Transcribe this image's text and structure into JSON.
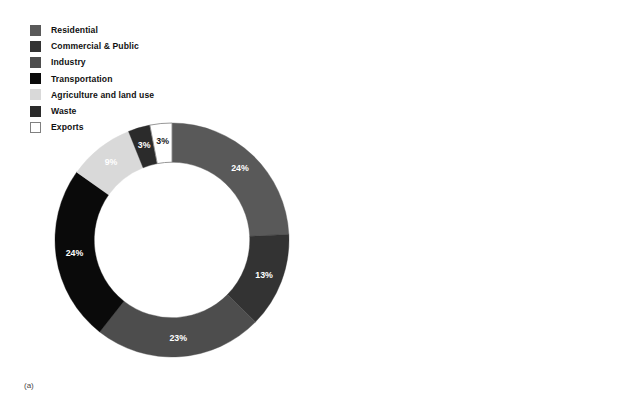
{
  "figure": {
    "background": "#ffffff",
    "panel_count": 2
  },
  "chart_data": [
    {
      "type": "pie",
      "variant": "donut",
      "panel": "a",
      "caption": "(a)",
      "title": "",
      "xlabel": "",
      "ylabel": "",
      "unit": "%",
      "start_angle_deg": 0,
      "direction": "clockwise",
      "inner_radius_ratio": 0.665,
      "total": 99,
      "legend_position": "top-left",
      "grid": false,
      "labels": [
        "Residential",
        "Commercial & Public",
        "Industry",
        "Transportation",
        "Agriculture and land use",
        "Waste",
        "Exports"
      ],
      "values": [
        24,
        13,
        23,
        24,
        9,
        3,
        3
      ],
      "value_labels": [
        "24%",
        "13%",
        "23%",
        "24%",
        "9%",
        "3%",
        "3%"
      ],
      "colors": [
        "#595959",
        "#333333",
        "#4d4d4d",
        "#0a0a0a",
        "#d9d9d9",
        "#2b2b2b",
        "#ffffff"
      ],
      "label_text_colors": [
        "#ffffff",
        "#ffffff",
        "#ffffff",
        "#ffffff",
        "#ffffff",
        "#ffffff",
        "#1a1a1a"
      ],
      "outlined_slices": [
        "Exports"
      ]
    },
    {
      "type": "pie",
      "variant": "donut",
      "panel": "b",
      "caption": "(b)",
      "title": "",
      "xlabel": "",
      "ylabel": "",
      "unit": "%",
      "start_angle_deg": 0,
      "direction": "clockwise",
      "inner_radius_ratio": 0.665,
      "total": 100,
      "legend_position": "top-left",
      "grid": false,
      "labels": [
        "Residential",
        "Commercial & Public",
        "Energy supply",
        "Transportation",
        "Agriculture and land use",
        "Waste",
        "Other"
      ],
      "values": [
        12,
        17,
        31,
        23,
        9,
        4,
        4
      ],
      "value_labels": [
        "12%",
        "17%",
        "31%",
        "23%",
        "9%",
        "4%",
        "4%"
      ],
      "colors": [
        "#595959",
        "#333333",
        "#4d4d4d",
        "#0a0a0a",
        "#d9d9d9",
        "#2b2b2b",
        "#ffffff"
      ],
      "label_text_colors": [
        "#ffffff",
        "#ffffff",
        "#ffffff",
        "#ffffff",
        "#ffffff",
        "#ffffff",
        "#1a1a1a"
      ],
      "outlined_slices": [
        "Other"
      ]
    }
  ],
  "legend_a": {
    "items": [
      {
        "label": "Residential",
        "color": "#595959",
        "outlined": false
      },
      {
        "label": "Commercial & Public",
        "color": "#333333",
        "outlined": false
      },
      {
        "label": "Industry",
        "color": "#4d4d4d",
        "outlined": false
      },
      {
        "label": "Transportation",
        "color": "#0a0a0a",
        "outlined": false
      },
      {
        "label": "Agriculture and land use",
        "color": "#d9d9d9",
        "outlined": false
      },
      {
        "label": "Waste",
        "color": "#2b2b2b",
        "outlined": false
      },
      {
        "label": "Exports",
        "color": "#ffffff",
        "outlined": true
      }
    ]
  },
  "legend_b": {
    "items": [
      {
        "label": "Residential",
        "color": "#595959",
        "outlined": false
      },
      {
        "label": "Commercial & Public",
        "color": "#333333",
        "outlined": false
      },
      {
        "label": "Energy supply",
        "color": "#4d4d4d",
        "outlined": false
      },
      {
        "label": "Transportation",
        "color": "#0a0a0a",
        "outlined": false
      },
      {
        "label": "Agriculture and land use",
        "color": "#d9d9d9",
        "outlined": false
      },
      {
        "label": "Waste",
        "color": "#2b2b2b",
        "outlined": false
      },
      {
        "label": "Other",
        "color": "#ffffff",
        "outlined": true
      }
    ]
  },
  "captions": {
    "a": "(a)",
    "b": "(b)"
  }
}
